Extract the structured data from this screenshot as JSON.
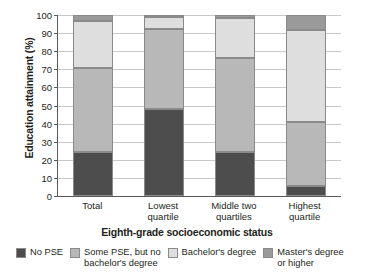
{
  "chart_data": {
    "type": "bar",
    "stacked": true,
    "title": "",
    "xlabel": "Eighth-grade socioeconomic status",
    "ylabel": "Education attainment (%)",
    "ylim": [
      0,
      100
    ],
    "yticks": [
      0,
      10,
      20,
      30,
      40,
      50,
      60,
      70,
      80,
      90,
      100
    ],
    "ytick_labels": [
      "0",
      "10",
      "20",
      "30",
      "40",
      "50",
      "60",
      "70",
      "80",
      "90",
      "100"
    ],
    "grid": true,
    "legend_position": "bottom",
    "categories": [
      "Total",
      "Lowest\nquartile",
      "Middle two\nquartiles",
      "Highest\nquartile"
    ],
    "series": [
      {
        "name": "No PSE",
        "color": "#4d4d4d",
        "values": [
          24.5,
          48.0,
          24.5,
          5.5
        ]
      },
      {
        "name": "Some PSE, but no\nbachelor's degree",
        "color": "#b8b8b8",
        "values": [
          46.0,
          44.5,
          52.0,
          35.5
        ]
      },
      {
        "name": "Bachelor's degree",
        "color": "#dedede",
        "values": [
          26.0,
          6.5,
          22.0,
          50.5
        ]
      },
      {
        "name": "Master's degree\nor higher",
        "color": "#9a9a9a",
        "values": [
          3.5,
          1.0,
          1.5,
          8.5
        ]
      }
    ]
  }
}
